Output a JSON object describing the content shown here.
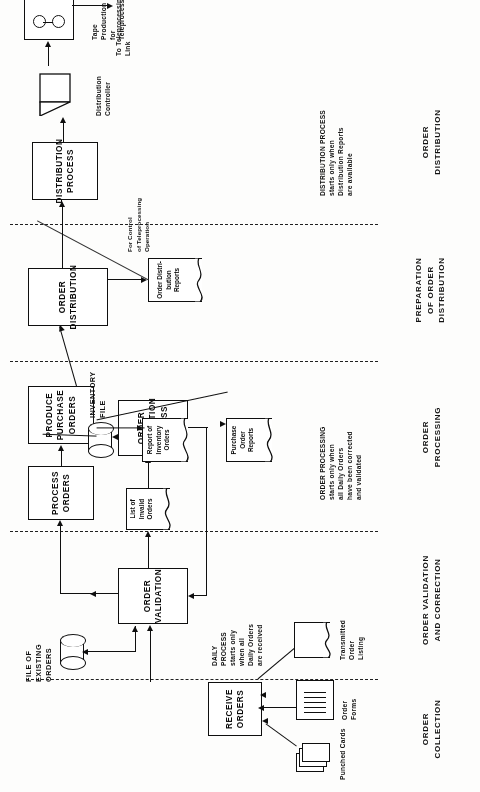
{
  "figure": {
    "kind": "systems-flowchart",
    "orientation": "rotated-90-ccw"
  },
  "phases": [
    {
      "id": "collection",
      "label": "ORDER\nCOLLECTION"
    },
    {
      "id": "validation",
      "label": "ORDER VALIDATION\nAND CORRECTION"
    },
    {
      "id": "processing",
      "label": "ORDER\nPROCESSING"
    },
    {
      "id": "preparation",
      "label": "PREPARATION\nOF ORDER\nDISTRIBUTION"
    },
    {
      "id": "distribution",
      "label": "ORDER\nDISTRIBUTION"
    }
  ],
  "processes": {
    "receive_orders": "RECEIVE\nORDERS",
    "order_validation": "ORDER\nVALIDATION",
    "order_correction": "ORDER\nCORRECTION\nPROCESS",
    "process_orders": "PROCESS\nORDERS",
    "produce_purchase_orders": "PRODUCE\nPURCHASE\nORDERS",
    "order_distribution": "ORDER\nDISTRIBUTION",
    "distribution_process": "DISTRIBUTION\nPROCESS"
  },
  "inputs": {
    "punched_cards": "Punched Cards",
    "order_forms": "Order\nForms",
    "transmitted_order_listing": "Transmitted\nOrder\nListing"
  },
  "stores": {
    "file_of_existing_orders": "FILE OF\nEXISTING\nORDERS",
    "inventory_file": "INVENTORY\nFILE"
  },
  "documents": {
    "list_of_invalid_orders": "List of\nInvalid\nOrders",
    "purchase_order_reports": "Purchase\nOrder\nReports",
    "report_of_inventory_orders": "Report of\nInventory\nOrders",
    "order_distribution_reports": "Order\nDistri-\nbution\nReports"
  },
  "devices": {
    "distribution_controller": "Distribution\nController",
    "tape_production": "Tape\nProduction\nfor\nTeleprocessing"
  },
  "annotations": {
    "daily_process": "DAILY\nPROCESS\nstarts only\nwhen all\nDaily Orders\nare received",
    "order_processing_note": "ORDER PROCESSING\nstarts only when\nall Daily Orders\nhave been corrected\nand validated",
    "distribution_process_note": "DISTRIBUTION PROCESS\nstarts only when\nDistribution Reports\nare available",
    "for_control": "For Control\nof Teleprocessing\nOperation",
    "to_teleprocessing_link": "To Teleprocessing\nLink"
  },
  "colors": {
    "ink": "#111111",
    "paper": "#fdfdfc",
    "divider": "#222222"
  }
}
